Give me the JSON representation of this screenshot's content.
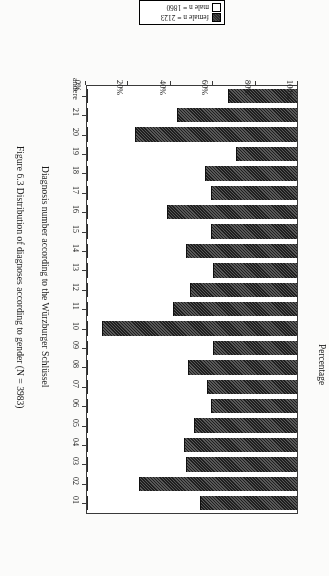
{
  "figure": {
    "caption": "Figure 6.3  Distribution of diagnoses according to gender (N = 3983)"
  },
  "legend": {
    "entries": [
      {
        "key": "female",
        "label": "female n = 2123",
        "swatch": "dark-hatched-swatch"
      },
      {
        "key": "male",
        "label": "male n = 1860",
        "swatch": "white-swatch"
      }
    ]
  },
  "axes": {
    "value_axis_title": "Percentage",
    "category_axis_title": "Diagnosis number according to the Würzburger Schlüssel",
    "value_ticks": [
      "0%",
      "20%",
      "40%",
      "60%",
      "80%",
      "100%"
    ]
  },
  "chart_data": {
    "type": "bar",
    "title": "Distribution of diagnoses according to gender (N = 3983)",
    "subtitle": "",
    "orientation": "horizontal-stacked-100",
    "stacked": true,
    "xlabel": "Diagnosis number according to the Würzburger Schlüssel",
    "ylabel": "Percentage",
    "ylim": [
      0,
      100
    ],
    "grid": false,
    "legend_position": "top",
    "categories": [
      "01",
      "02",
      "03",
      "04",
      "05",
      "06",
      "07",
      "08",
      "09",
      "10",
      "11",
      "12",
      "13",
      "14",
      "15",
      "16",
      "17",
      "18",
      "19",
      "20",
      "21",
      "andere"
    ],
    "series": [
      {
        "name": "female n = 2123",
        "values": [
          46,
          75,
          53,
          54,
          49,
          41,
          43,
          52,
          40,
          93,
          59,
          51,
          40,
          53,
          41,
          62,
          41,
          44,
          29,
          77,
          57,
          33
        ]
      },
      {
        "name": "male n = 1860",
        "values": [
          54,
          25,
          47,
          46,
          51,
          59,
          57,
          48,
          60,
          7,
          41,
          49,
          60,
          47,
          59,
          38,
          59,
          56,
          71,
          23,
          43,
          67
        ]
      }
    ],
    "value_ticks": [
      0,
      20,
      40,
      60,
      80,
      100
    ],
    "total_n": 3983
  }
}
